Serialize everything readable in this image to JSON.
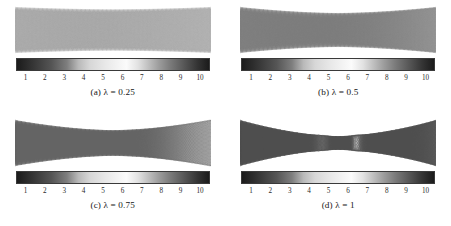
{
  "figure": {
    "background": "#ffffff",
    "layout": "2x2 grid of lattice mesh panels, each with grayscale colorbar and caption"
  },
  "colorbar": {
    "ticks": [
      "1",
      "2",
      "3",
      "4",
      "5",
      "6",
      "7",
      "8",
      "9",
      "10"
    ],
    "min": 1,
    "max": 10,
    "peak_value": 6,
    "dark_end": "#1b1b1b",
    "light_peak": "#fbfbfb",
    "mid_gray": "#8a8a8a"
  },
  "panels": [
    {
      "id": "a",
      "caption": "(a)  λ = 0.25",
      "lambda": 0.25,
      "mesh": {
        "name": "braided-lattice-mesh-a",
        "strands": 17,
        "cells_along": 26,
        "neck_ratio": 0.9,
        "intensity": 0.3,
        "stroke": "#9a9a9a"
      }
    },
    {
      "id": "b",
      "caption": "(b)  λ = 0.5",
      "lambda": 0.5,
      "mesh": {
        "name": "braided-lattice-mesh-b",
        "strands": 17,
        "cells_along": 30,
        "neck_ratio": 0.74,
        "intensity": 0.52,
        "stroke": "#7d7d7d"
      }
    },
    {
      "id": "c",
      "caption": "(c)  λ = 0.75",
      "lambda": 0.75,
      "mesh": {
        "name": "braided-lattice-mesh-c",
        "strands": 17,
        "cells_along": 34,
        "neck_ratio": 0.56,
        "intensity": 0.72,
        "stroke": "#636363"
      }
    },
    {
      "id": "d",
      "caption": "(d)  λ = 1",
      "lambda": 1,
      "mesh": {
        "name": "braided-lattice-mesh-d",
        "strands": 17,
        "cells_along": 40,
        "neck_ratio": 0.3,
        "intensity": 0.92,
        "stroke": "#4e4e4e"
      }
    }
  ],
  "chart_data": {
    "type": "heatmap",
    "title": "",
    "xlabel": "",
    "ylabel": "",
    "colorbar_ticks": [
      1,
      2,
      3,
      4,
      5,
      6,
      7,
      8,
      9,
      10
    ],
    "colorbar_range": [
      1,
      10
    ],
    "colormap": "grayscale dark-light-dark (bone/inverted)",
    "legend_position": "below each panel",
    "grid": false,
    "series": [
      {
        "name": "(a) λ = 0.25",
        "neck_ratio": 0.9,
        "mean_intensity": 0.3
      },
      {
        "name": "(b) λ = 0.5",
        "neck_ratio": 0.74,
        "mean_intensity": 0.52
      },
      {
        "name": "(c) λ = 0.75",
        "neck_ratio": 0.56,
        "mean_intensity": 0.72
      },
      {
        "name": "(d) λ = 1",
        "neck_ratio": 0.3,
        "mean_intensity": 0.92
      }
    ],
    "categories": [
      "(a) λ = 0.25",
      "(b) λ = 0.5",
      "(c) λ = 0.75",
      "(d) λ = 1"
    ],
    "values": [
      0.3,
      0.52,
      0.72,
      0.92
    ]
  }
}
